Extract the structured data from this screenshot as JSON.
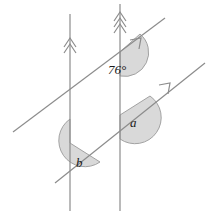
{
  "diagram": {
    "canvas": {
      "width": 211,
      "height": 218,
      "background": "#ffffff"
    },
    "style": {
      "line_color": "#8c8c8c",
      "line_width": 1.2,
      "arc_fill": "#d9d9d9",
      "arc_stroke": "#8c8c8c",
      "label_color": "#1a1a1a"
    },
    "labels": {
      "angle_known": "76°",
      "angle_a": "a",
      "angle_b": "b"
    },
    "lines": [
      {
        "name": "left-vertical-line",
        "kind": "parallel-pair-member",
        "marker": "double-chevron",
        "x1": 70,
        "y1": 14,
        "x2": 70,
        "y2": 211
      },
      {
        "name": "right-vertical-line",
        "kind": "parallel-pair-member",
        "marker": "double-chevron",
        "x1": 120,
        "y1": 4,
        "x2": 120,
        "y2": 211
      },
      {
        "name": "upper-transversal",
        "kind": "transversal",
        "marker": "single-arrow",
        "x1": 13,
        "y1": 132,
        "x2": 165,
        "y2": 18
      },
      {
        "name": "lower-transversal",
        "kind": "transversal",
        "marker": "single-arrow",
        "x1": 55,
        "y1": 183,
        "x2": 205,
        "y2": 63
      }
    ],
    "angle_marks": [
      {
        "name": "angle-76-arc",
        "vertex_x": 120,
        "vertex_y": 52,
        "label": "76°",
        "label_x": 108,
        "label_y": 74
      },
      {
        "name": "angle-a-arc",
        "vertex_x": 120,
        "vertex_y": 115,
        "label": "a",
        "label_x": 130,
        "label_y": 127
      },
      {
        "name": "angle-b-arc",
        "vertex_x": 70,
        "vertex_y": 143,
        "label": "b",
        "label_x": 76,
        "label_y": 167
      }
    ]
  }
}
